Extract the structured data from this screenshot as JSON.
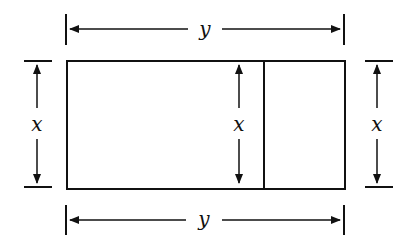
{
  "diagram": {
    "labels": {
      "top_width": "y",
      "bottom_width": "y",
      "left_height": "x",
      "middle_height": "x",
      "right_height": "x"
    },
    "stroke_color": "#111111",
    "background_color": "#ffffff"
  }
}
